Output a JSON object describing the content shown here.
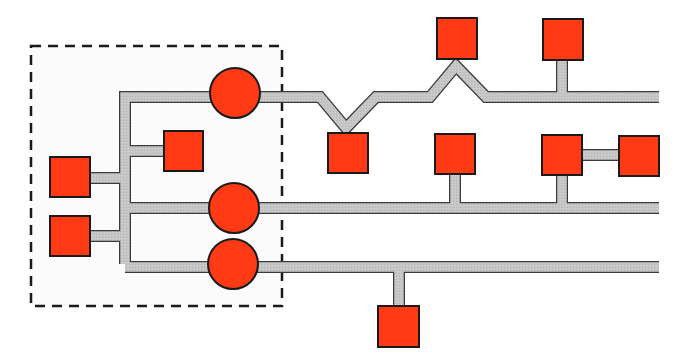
{
  "diagram": {
    "type": "network-topology",
    "colors": {
      "node_fill": "#ff3a14",
      "node_stroke": "#1a1a1a",
      "link_fill": "#c4c4c4",
      "link_stroke": "#3a3a3a",
      "group_border": "#1a1a1a",
      "group_fill": "#fbfbfb"
    },
    "group": {
      "label": "",
      "x": 31,
      "y": 46,
      "w": 251,
      "h": 260
    },
    "hubs": [
      {
        "id": "hub-1",
        "shape": "circle",
        "cx": 235,
        "cy": 93,
        "r": 25
      },
      {
        "id": "hub-2",
        "shape": "circle",
        "cx": 234,
        "cy": 208,
        "r": 25
      },
      {
        "id": "hub-3",
        "shape": "circle",
        "cx": 233,
        "cy": 264,
        "r": 25
      }
    ],
    "nodes": [
      {
        "id": "local-1",
        "shape": "square",
        "x": 50,
        "y": 157,
        "w": 40,
        "h": 40
      },
      {
        "id": "local-2",
        "shape": "square",
        "x": 50,
        "y": 216,
        "w": 40,
        "h": 40
      },
      {
        "id": "local-3",
        "shape": "square",
        "x": 164,
        "y": 131,
        "w": 39,
        "h": 40
      },
      {
        "id": "remote-1",
        "shape": "square",
        "x": 328,
        "y": 133,
        "w": 40,
        "h": 40
      },
      {
        "id": "remote-2",
        "shape": "square",
        "x": 437,
        "y": 18,
        "w": 40,
        "h": 41
      },
      {
        "id": "remote-3",
        "shape": "square",
        "x": 543,
        "y": 19,
        "w": 40,
        "h": 41
      },
      {
        "id": "remote-4",
        "shape": "square",
        "x": 435,
        "y": 134,
        "w": 40,
        "h": 40
      },
      {
        "id": "remote-5",
        "shape": "square",
        "x": 542,
        "y": 135,
        "w": 40,
        "h": 40
      },
      {
        "id": "remote-6",
        "shape": "square",
        "x": 619,
        "y": 136,
        "w": 40,
        "h": 40
      },
      {
        "id": "remote-7",
        "shape": "square",
        "x": 378,
        "y": 306,
        "w": 41,
        "h": 41
      }
    ],
    "links": {
      "trunk": "M125 264 L125 97 L212 97",
      "top_line": "M258 97 L320 97 L346 128 L376 97 L430 97 L456 66 L486 97 L659 97",
      "mid_line": "M125 208 L659 208",
      "bottom_line": "M125 267 L659 267",
      "local_1": "M90 178 L125 178",
      "local_2": "M90 236 L125 236",
      "local_3": "M125 151 L164 151",
      "remote_3_drop": "M562 60 L562 97",
      "remote_4_drop": "M455 174 L455 208",
      "remote_5_drop": "M562 175 L562 208",
      "remote_5_6": "M582 155 L619 155",
      "remote_7_drop": "M399 267 L399 306"
    }
  }
}
